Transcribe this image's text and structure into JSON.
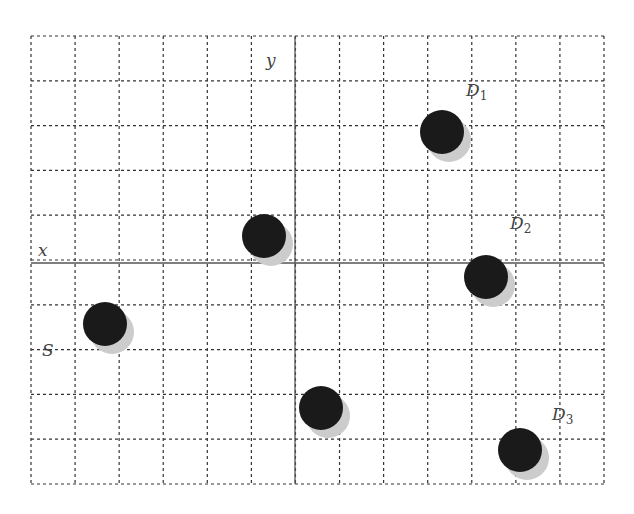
{
  "diagram": {
    "grid": {
      "left": 31,
      "top": 36,
      "right": 604,
      "bottom": 484,
      "cols": 13,
      "rows": 10,
      "line_color": "#333333",
      "axis_color": "#555555"
    },
    "axes": {
      "x_label": "x",
      "y_label": "y",
      "origin_px": [
        295,
        263
      ]
    },
    "points": [
      {
        "id": "P0",
        "cx": 264,
        "cy": 236,
        "label": ""
      },
      {
        "id": "D1",
        "cx": 442,
        "cy": 132,
        "label": "D",
        "sub": "1",
        "label_x": 466,
        "label_y": 82
      },
      {
        "id": "D2",
        "cx": 486,
        "cy": 277,
        "label": "D",
        "sub": "2",
        "label_x": 510,
        "label_y": 215
      },
      {
        "id": "S",
        "cx": 105,
        "cy": 324,
        "label": "S",
        "sub": "",
        "label_x": 42,
        "label_y": 342
      },
      {
        "id": "P4",
        "cx": 321,
        "cy": 408,
        "label": ""
      },
      {
        "id": "D3",
        "cx": 520,
        "cy": 450,
        "label": "D",
        "sub": "3",
        "label_x": 552,
        "label_y": 406
      }
    ],
    "dot_radius": 22,
    "dot_color": "#1a1a1a",
    "shadow_color": "#cccccc"
  }
}
